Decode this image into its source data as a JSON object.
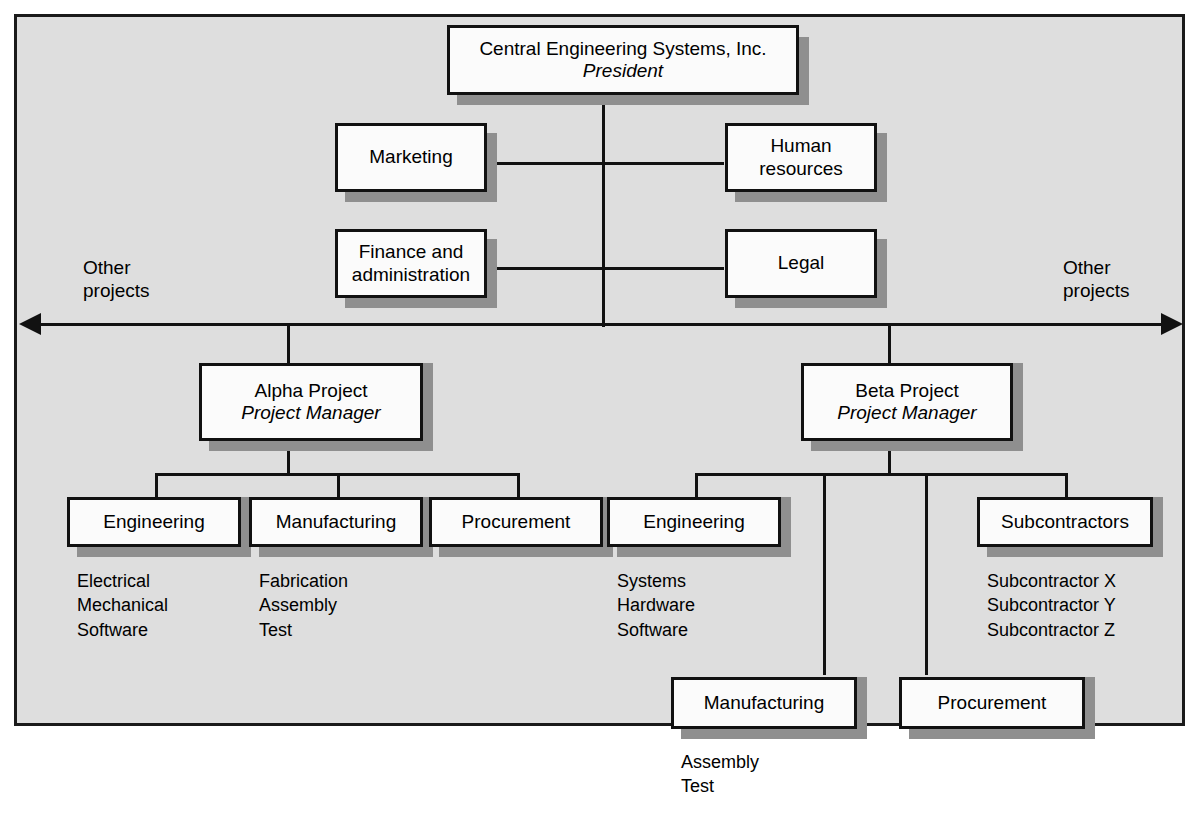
{
  "diagram": {
    "type": "organization-chart",
    "title_text": "Central Engineering Systems, Inc.",
    "frame_background": "#dedede",
    "page_background": "#ffffff",
    "box_fill": "#fbfbfb",
    "line_color": "#111111",
    "shadow_color": "#8f8f8f"
  },
  "nodes": {
    "president": {
      "name": "Central Engineering Systems, Inc.",
      "role": "President"
    },
    "marketing": {
      "name": "Marketing"
    },
    "human_resources": {
      "line1": "Human",
      "line2": "resources"
    },
    "finance": {
      "line1": "Finance and",
      "line2": "administration"
    },
    "legal": {
      "name": "Legal"
    },
    "alpha_project": {
      "name": "Alpha Project",
      "role": "Project Manager"
    },
    "beta_project": {
      "name": "Beta Project",
      "role": "Project Manager"
    },
    "alpha_engineering": {
      "name": "Engineering"
    },
    "alpha_manufacturing": {
      "name": "Manufacturing"
    },
    "alpha_procurement": {
      "name": "Procurement"
    },
    "beta_engineering": {
      "name": "Engineering"
    },
    "beta_subcontractors": {
      "name": "Subcontractors"
    },
    "beta_manufacturing": {
      "name": "Manufacturing"
    },
    "beta_procurement": {
      "name": "Procurement"
    }
  },
  "sublists": {
    "alpha_engineering": "Electrical\nMechanical\nSoftware",
    "alpha_manufacturing": "Fabrication\nAssembly\nTest",
    "beta_engineering": "Systems\nHardware\nSoftware",
    "beta_subcontractors": "Subcontractor X\nSubcontractor Y\nSubcontractor Z",
    "beta_manufacturing": "Assembly\nTest"
  },
  "side_labels": {
    "left": {
      "line1": "Other",
      "line2": "projects"
    },
    "right": {
      "line1": "Other",
      "line2": "projects"
    }
  }
}
